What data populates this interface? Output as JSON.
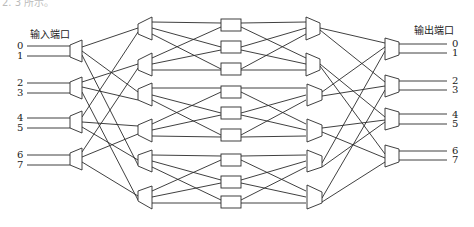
{
  "diagram": {
    "type": "multistage switching network (5-stage Clos/Benes-like)",
    "input_label": "输入端口",
    "output_label": "输出端口",
    "top_fragment": "2. 3 所示。",
    "input_ports": [
      "0",
      "1",
      "2",
      "3",
      "4",
      "5",
      "6",
      "7"
    ],
    "output_ports": [
      "0",
      "1",
      "2",
      "3",
      "4",
      "5",
      "6",
      "7"
    ],
    "stages": [
      {
        "name": "input-stage",
        "count": 4,
        "shape": "trapezoid-expanding"
      },
      {
        "name": "stage-2",
        "count": 6,
        "shape": "trapezoid-expanding"
      },
      {
        "name": "middle-stage",
        "count": 9,
        "shape": "rectangle"
      },
      {
        "name": "stage-4",
        "count": 6,
        "shape": "trapezoid-converging"
      },
      {
        "name": "output-stage",
        "count": 4,
        "shape": "trapezoid-converging"
      }
    ],
    "colors": {
      "line": "#2a2a2a",
      "background": "#ffffff"
    }
  }
}
